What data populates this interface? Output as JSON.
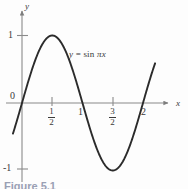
{
  "figure": {
    "caption": "Figure 5.1",
    "background_color": "#fdfdfd",
    "line_color": "#2b2b2b",
    "axis_color": "#7d7d7d"
  },
  "axes": {
    "x_name": "x",
    "y_name": "y",
    "origin_label": "0",
    "y_tick_pos_label": "1",
    "y_tick_neg_label": "-1",
    "x_tick_labels": [
      {
        "value": 0.5,
        "display": "1/2",
        "numerator": "1",
        "denominator": "2"
      },
      {
        "value": 1,
        "display": "1"
      },
      {
        "value": 1.5,
        "display": "3/2",
        "numerator": "3",
        "denominator": "2"
      },
      {
        "value": 2,
        "display": "2"
      }
    ]
  },
  "curve": {
    "label_full": "y = sin πx",
    "label_lhs": "y",
    "label_op": "=",
    "label_fn": "sin",
    "label_arg": "πx"
  },
  "chart_data": {
    "type": "line",
    "title": "",
    "subtitle": "",
    "xlabel": "x",
    "ylabel": "y",
    "xlim": [
      -0.15,
      2.2
    ],
    "ylim": [
      -1.4,
      1.35
    ],
    "grid": false,
    "legend": null,
    "annotations": [
      {
        "text": "y = sin πx",
        "x": 0.8,
        "y": 0.82
      }
    ],
    "xticks": [
      0,
      0.5,
      1,
      1.5,
      2
    ],
    "xticklabels": [
      "0",
      "1/2",
      "1",
      "3/2",
      "2"
    ],
    "yticks": [
      -1,
      0,
      1
    ],
    "yticklabels": [
      "-1",
      "0",
      "1"
    ],
    "series": [
      {
        "name": "y = sin πx",
        "expression": "sin(pi*x)",
        "x": [
          -0.15,
          -0.1,
          0.0,
          0.1,
          0.2,
          0.25,
          0.3,
          0.4,
          0.5,
          0.6,
          0.7,
          0.75,
          0.8,
          0.9,
          1.0,
          1.1,
          1.2,
          1.25,
          1.3,
          1.4,
          1.5,
          1.6,
          1.7,
          1.75,
          1.8,
          1.9,
          2.0,
          2.1,
          2.15
        ],
        "y": [
          -0.454,
          -0.309,
          0.0,
          0.309,
          0.588,
          0.707,
          0.809,
          0.951,
          1.0,
          0.951,
          0.809,
          0.707,
          0.588,
          0.309,
          0.0,
          -0.309,
          -0.588,
          -0.707,
          -0.809,
          -0.951,
          -1.0,
          -0.951,
          -0.809,
          -0.707,
          -0.588,
          -0.309,
          0.0,
          0.309,
          0.454
        ]
      }
    ]
  }
}
